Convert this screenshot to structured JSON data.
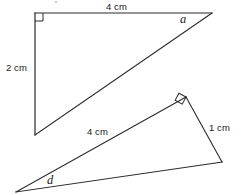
{
  "figure": {
    "stroke_color": "#2b2b2b",
    "text_color": "#1a1a1a",
    "background_color": "#ffffff",
    "stroke_width": 1.1
  },
  "labels": {
    "top_horizontal_length": "4 cm",
    "left_vertical_length": "2 cm",
    "angle_a": "a",
    "middle_hypotenuse_length": "4 cm",
    "right_short_length": "1 cm",
    "angle_d": "d"
  },
  "triangles": [
    {
      "name": "upper-triangle",
      "right_angle_at": "top-left",
      "vertices": {
        "right_angle_corner": [
          35,
          13
        ],
        "top_right": [
          212,
          13
        ],
        "bottom_left": [
          35,
          135
        ]
      },
      "sides": [
        {
          "name": "horizontal-leg",
          "from": [
            35,
            13
          ],
          "to": [
            212,
            13
          ],
          "label": "4 cm"
        },
        {
          "name": "vertical-leg",
          "from": [
            35,
            13
          ],
          "to": [
            35,
            135
          ],
          "label": "2 cm"
        },
        {
          "name": "hypotenuse",
          "from": [
            35,
            135
          ],
          "to": [
            212,
            13
          ],
          "label": ""
        }
      ],
      "marked_angle": {
        "label": "a",
        "at_vertex": "top_right"
      },
      "right_angle_marker": {
        "at": [
          35,
          13
        ],
        "size": 8,
        "rotation_deg": 0
      }
    },
    {
      "name": "lower-triangle",
      "right_angle_at": "apex",
      "vertices": {
        "right_angle_corner": [
          186,
          97
        ],
        "bottom_right": [
          222,
          162
        ],
        "bottom_left": [
          16,
          192
        ]
      },
      "sides": [
        {
          "name": "hypotenuse",
          "from": [
            16,
            192
          ],
          "to": [
            186,
            97
          ],
          "label": "4 cm"
        },
        {
          "name": "short-leg",
          "from": [
            186,
            97
          ],
          "to": [
            222,
            162
          ],
          "label": "1 cm"
        },
        {
          "name": "base",
          "from": [
            16,
            192
          ],
          "to": [
            222,
            162
          ],
          "label": ""
        }
      ],
      "marked_angle": {
        "label": "d",
        "at_vertex": "bottom_left"
      },
      "right_angle_marker": {
        "at": [
          186,
          97
        ],
        "size": 8,
        "rotation_deg": 28
      }
    }
  ]
}
